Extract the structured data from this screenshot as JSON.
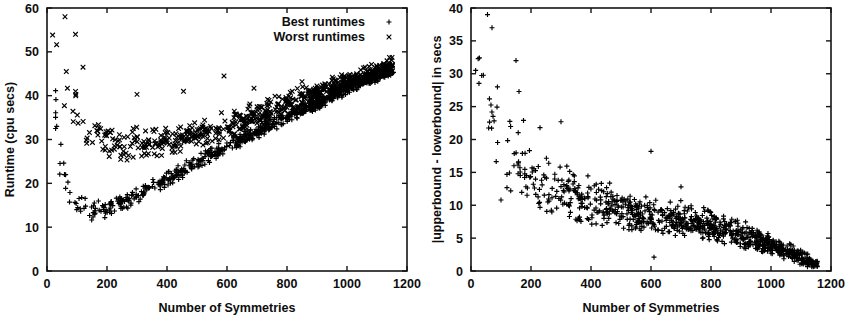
{
  "figure": {
    "background_color": "#ffffff",
    "marker_color": "#000000",
    "panels": [
      "left",
      "right"
    ]
  },
  "chart_data": [
    {
      "type": "scatter",
      "panel": "left",
      "title": "",
      "xlabel": "Number of Symmetries",
      "ylabel": "Runtime (cpu secs)",
      "xlim": [
        0,
        1200
      ],
      "ylim": [
        0,
        60
      ],
      "xticks": [
        0,
        200,
        400,
        600,
        800,
        1000,
        1200
      ],
      "yticks": [
        0,
        10,
        20,
        30,
        40,
        50,
        60
      ],
      "grid": false,
      "legend_position": "top-right",
      "legend": [
        {
          "name": "Best runtimes",
          "marker": "plus"
        },
        {
          "name": "Worst runtimes",
          "marker": "cross"
        }
      ],
      "series": [
        {
          "name": "Best runtimes",
          "marker": "plus",
          "description": "Lower band: falls steeply from ~50 near x=20 to a minimum of ~13 near x=150, then rises roughly linearly to ~46 at x=1150.",
          "trend": {
            "model": "piecewise",
            "knots_x": [
              15,
              40,
              80,
              150,
              250,
              400,
              600,
              800,
              1000,
              1150
            ],
            "knots_y": [
              50,
              26,
              17,
              13.5,
              15.5,
              21,
              28.5,
              35,
              41.5,
              46
            ]
          },
          "scatter_band": {
            "sigma_x": [
              15,
              40,
              150,
              400,
              800,
              1150
            ],
            "sigma_y": [
              5.0,
              3.2,
              1.8,
              1.4,
              1.2,
              1.0
            ]
          },
          "density": {
            "n_points": 760,
            "x_distribution": "denser at high x"
          }
        },
        {
          "name": "Worst runtimes",
          "marker": "cross",
          "description": "Upper band: falls steeply from ~60 near x=20 to a minimum of ~28 near x=250, then rises roughly linearly to ~47 at x=1150, merging with the best-runtime band.",
          "trend": {
            "model": "piecewise",
            "knots_x": [
              15,
              40,
              80,
              150,
              250,
              400,
              600,
              800,
              1000,
              1150
            ],
            "knots_y": [
              58,
              48,
              38,
              31,
              28.5,
              29.5,
              33,
              38,
              43,
              47
            ]
          },
          "scatter_band": {
            "sigma_x": [
              15,
              40,
              150,
              400,
              800,
              1150
            ],
            "sigma_y": [
              6.0,
              5.0,
              3.0,
              2.6,
              2.2,
              1.4
            ]
          },
          "density": {
            "n_points": 640,
            "x_distribution": "denser at high x"
          },
          "outliers": [
            {
              "x": 300,
              "y": 40.3
            },
            {
              "x": 455,
              "y": 41.0
            },
            {
              "x": 590,
              "y": 44.5
            },
            {
              "x": 690,
              "y": 41.7
            },
            {
              "x": 850,
              "y": 43.2
            },
            {
              "x": 120,
              "y": 46.5
            },
            {
              "x": 95,
              "y": 54.0
            },
            {
              "x": 60,
              "y": 58.0
            }
          ]
        }
      ]
    },
    {
      "type": "scatter",
      "panel": "right",
      "title": "",
      "xlabel": "Number of Symmetries",
      "ylabel": "|upperbound - lowerbound| in secs",
      "xlim": [
        0,
        1200
      ],
      "ylim": [
        0,
        40
      ],
      "xticks": [
        0,
        200,
        400,
        600,
        800,
        1000,
        1200
      ],
      "yticks": [
        0,
        5,
        10,
        15,
        20,
        25,
        30,
        35,
        40
      ],
      "grid": false,
      "legend_position": "none",
      "legend": [],
      "series": [
        {
          "name": "|upperbound - lowerbound|",
          "marker": "plus",
          "description": "Single series decaying from ~30-40 near x=20-80 toward ~0-1 at x=1150, with the vertical spread narrowing steadily as x increases.",
          "trend": {
            "model": "piecewise",
            "knots_x": [
              15,
              60,
              120,
              200,
              300,
              400,
              500,
              600,
              700,
              800,
              900,
              1000,
              1100,
              1150
            ],
            "knots_y": [
              32,
              26,
              17,
              13.5,
              12,
              10.5,
              9.5,
              8.5,
              7.8,
              6.8,
              5.6,
              4.0,
              2.0,
              1.0
            ]
          },
          "scatter_band": {
            "sigma_x": [
              15,
              60,
              120,
              300,
              600,
              900,
              1100,
              1150
            ],
            "sigma_y": [
              5.5,
              6.0,
              4.5,
              3.0,
              2.2,
              1.6,
              0.9,
              0.5
            ]
          },
          "density": {
            "n_points": 900,
            "x_distribution": "denser at high x"
          },
          "outliers": [
            {
              "x": 55,
              "y": 39.0
            },
            {
              "x": 70,
              "y": 37.0
            },
            {
              "x": 150,
              "y": 32.0
            },
            {
              "x": 160,
              "y": 27.3
            },
            {
              "x": 300,
              "y": 22.7
            },
            {
              "x": 600,
              "y": 18.2
            },
            {
              "x": 700,
              "y": 12.8
            },
            {
              "x": 100,
              "y": 10.8
            },
            {
              "x": 610,
              "y": 2.1
            },
            {
              "x": 175,
              "y": 22.9
            },
            {
              "x": 230,
              "y": 21.8
            }
          ]
        }
      ]
    }
  ]
}
